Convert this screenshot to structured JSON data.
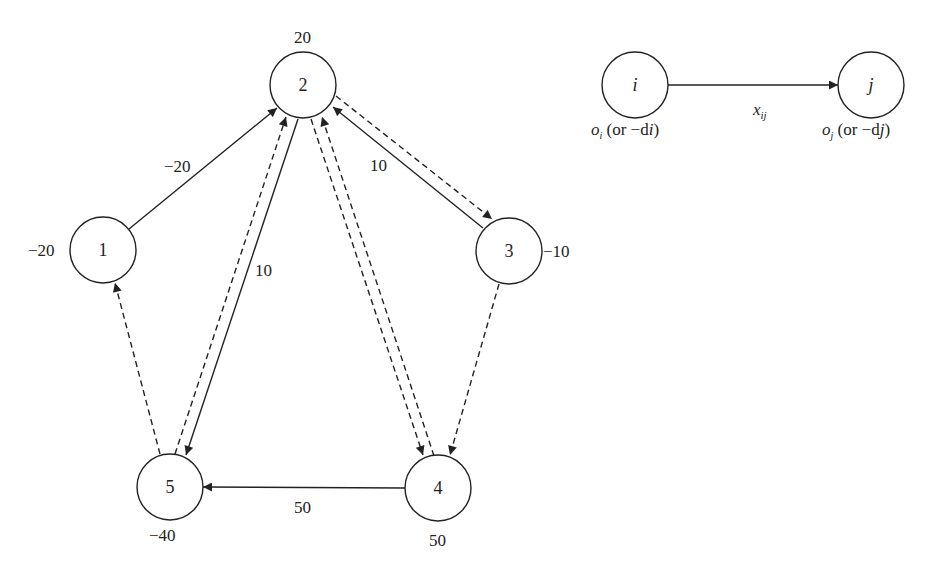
{
  "diagram": {
    "title": "",
    "nodes": [
      {
        "id": "1",
        "label": "1",
        "value": "-20",
        "cx": 103,
        "cy": 250
      },
      {
        "id": "2",
        "label": "2",
        "value": "20",
        "cx": 303,
        "cy": 85
      },
      {
        "id": "3",
        "label": "3",
        "value": "-10",
        "cx": 509,
        "cy": 251
      },
      {
        "id": "4",
        "label": "4",
        "value": "50",
        "cx": 438,
        "cy": 488
      },
      {
        "id": "5",
        "label": "5",
        "value": "-40",
        "cx": 170,
        "cy": 487
      }
    ],
    "value_labels": {
      "n1": "−20",
      "n2": "20",
      "n3": "−10",
      "n4": "50",
      "n5": "−40"
    },
    "edges": [
      {
        "from": "1",
        "to": "2",
        "style": "solid",
        "label": "−20"
      },
      {
        "from": "2",
        "to": "5",
        "style": "solid",
        "label": "10"
      },
      {
        "from": "5",
        "to": "2",
        "style": "dashed",
        "label": ""
      },
      {
        "from": "3",
        "to": "2",
        "style": "solid",
        "label": "10"
      },
      {
        "from": "2",
        "to": "3",
        "style": "dashed",
        "label": ""
      },
      {
        "from": "2",
        "to": "4",
        "style": "dashed",
        "label": ""
      },
      {
        "from": "4",
        "to": "2",
        "style": "dashed",
        "label": ""
      },
      {
        "from": "3",
        "to": "4",
        "style": "dashed",
        "label": ""
      },
      {
        "from": "5",
        "to": "1",
        "style": "dashed",
        "label": ""
      },
      {
        "from": "4",
        "to": "5",
        "style": "solid",
        "label": "50"
      }
    ],
    "edge_labels": {
      "e12": "−20",
      "e25": "10",
      "e32": "10",
      "e45": "50"
    },
    "legend": {
      "node_i": "i",
      "node_j": "j",
      "edge_label": "x",
      "edge_label_sub": "ij",
      "supply_i": "o",
      "supply_i_sub": "i",
      "supply_i_rest": " (or −d",
      "supply_i_rest_sub": "i",
      "supply_j": "o",
      "supply_j_sub": "j",
      "supply_j_rest": " (or −d",
      "supply_j_rest_sub": "j",
      "close_paren": ")"
    }
  }
}
